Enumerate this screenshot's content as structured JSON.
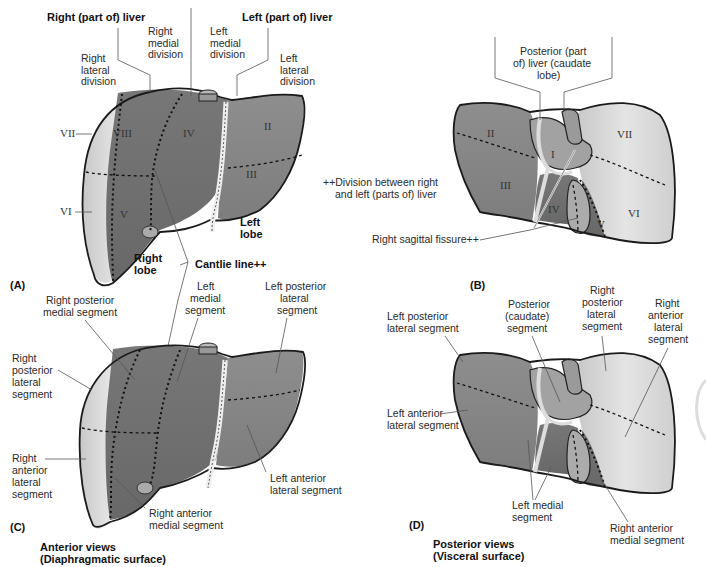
{
  "panel_a": {
    "id": "(A)",
    "title_right": "Right (part of) liver",
    "title_left": "Left (part of) liver",
    "right_medial_division": [
      "Right",
      "medial",
      "division"
    ],
    "left_medial_division": [
      "Left",
      "medial",
      "division"
    ],
    "right_lateral_division": [
      "Right",
      "lateral",
      "division"
    ],
    "left_lateral_division": [
      "Left",
      "lateral",
      "division"
    ],
    "segments": [
      "VII",
      "VIII",
      "IV",
      "II",
      "III",
      "VI",
      "V"
    ],
    "right_lobe": [
      "Right",
      "lobe"
    ],
    "left_lobe": [
      "Left",
      "lobe"
    ],
    "cantlie_line": "Cantlie line++"
  },
  "panel_b": {
    "id": "(B)",
    "caudate_label": [
      "Posterior (part",
      "of) liver (caudate",
      "lobe)"
    ],
    "segments": [
      "II",
      "I",
      "VII",
      "III",
      "IV",
      "V",
      "VI"
    ],
    "footnote": [
      "++Division between right",
      "and left (parts of) liver"
    ],
    "right_sagittal_fissure": "Right sagittal fissure++"
  },
  "panel_c": {
    "id": "(C)",
    "right_posterior_medial": [
      "Right posterior",
      "medial segment"
    ],
    "left_medial": [
      "Left",
      "medial",
      "segment"
    ],
    "left_posterior_lateral": [
      "Left posterior",
      "lateral",
      "segment"
    ],
    "right_posterior_lateral": [
      "Right",
      "posterior",
      "lateral",
      "segment"
    ],
    "right_anterior_lateral": [
      "Right",
      "anterior",
      "lateral",
      "segment"
    ],
    "left_anterior_lateral": [
      "Left anterior",
      "lateral segment"
    ],
    "right_anterior_medial": [
      "Right anterior",
      "medial segment"
    ],
    "caption": [
      "Anterior views",
      "(Diaphragmatic surface)"
    ]
  },
  "panel_d": {
    "id": "(D)",
    "left_posterior_lateral": [
      "Left posterior",
      "lateral segment"
    ],
    "posterior_caudate": [
      "Posterior",
      "(caudate)",
      "segment"
    ],
    "right_posterior_lateral": [
      "Right",
      "posterior",
      "lateral",
      "segment"
    ],
    "right_anterior_lateral": [
      "Right",
      "anterior",
      "lateral",
      "segment"
    ],
    "left_anterior_lateral": [
      "Left anterior",
      "lateral segment"
    ],
    "left_medial": [
      "Left medial",
      "segment"
    ],
    "right_anterior_medial": [
      "Right anterior",
      "medial segment"
    ],
    "caption": [
      "Posterior views",
      "(Visceral surface)"
    ]
  },
  "colors": {
    "dark_segment": "#6e6e6e",
    "mid_segment": "#8a8a8a",
    "light_segment": "#d6d6d6",
    "caudate": "#a0a0a0",
    "outline": "#1a1a1a"
  }
}
